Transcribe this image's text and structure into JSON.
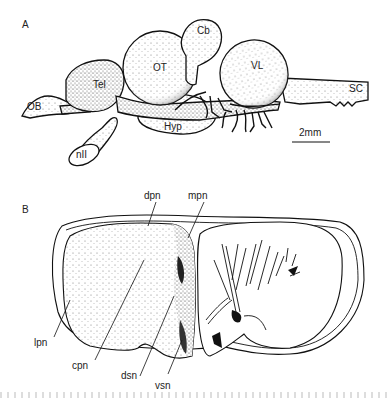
{
  "figure": {
    "panel_a": {
      "letter": "A",
      "labels": {
        "ob": "OB",
        "tel": "Tel",
        "ot": "OT",
        "cb": "Cb",
        "vl": "VL",
        "sc": "SC",
        "hyp": "Hyp",
        "nii": "nII"
      },
      "scale_bar": "2mm"
    },
    "panel_b": {
      "letter": "B",
      "labels": {
        "dpn": "dpn",
        "mpn": "mpn",
        "lpn": "lpn",
        "cpn": "cpn",
        "dsn": "dsn",
        "vsn": "vsn"
      }
    }
  }
}
